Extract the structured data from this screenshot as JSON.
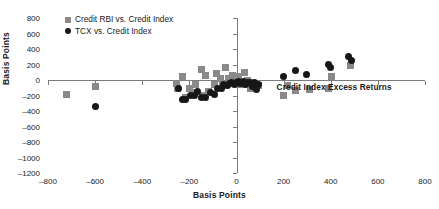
{
  "chart_data": {
    "type": "scatter",
    "title": "",
    "xlabel": "Basis Points",
    "ylabel": "Basis Points",
    "xlim": [
      -800,
      800
    ],
    "ylim": [
      -1200,
      800
    ],
    "xticks": [
      -800,
      -600,
      -400,
      -200,
      0,
      200,
      400,
      600,
      800
    ],
    "yticks": [
      800,
      600,
      400,
      200,
      0,
      -200,
      -400,
      -600,
      -800,
      -1000,
      -1200
    ],
    "grid": false,
    "legend_position": "top-left",
    "annotations": [
      {
        "text": "Credit Index Excess Returns",
        "x": 170,
        "y": -90
      }
    ],
    "series": [
      {
        "name": "Credit RBI vs. Credit Index",
        "marker": "square",
        "color": "#898989",
        "points": [
          [
            -720,
            -190
          ],
          [
            -600,
            -85
          ],
          [
            -255,
            -40
          ],
          [
            -250,
            -115
          ],
          [
            -230,
            40
          ],
          [
            -215,
            -230
          ],
          [
            -200,
            -105
          ],
          [
            -185,
            -160
          ],
          [
            -175,
            -60
          ],
          [
            -150,
            130
          ],
          [
            -145,
            -200
          ],
          [
            -130,
            55
          ],
          [
            -120,
            -145
          ],
          [
            -95,
            -60
          ],
          [
            -85,
            85
          ],
          [
            -70,
            25
          ],
          [
            -60,
            -70
          ],
          [
            -45,
            160
          ],
          [
            -35,
            15
          ],
          [
            -25,
            -30
          ],
          [
            -15,
            60
          ],
          [
            -5,
            -15
          ],
          [
            10,
            40
          ],
          [
            20,
            -55
          ],
          [
            35,
            100
          ],
          [
            45,
            -10
          ],
          [
            60,
            -105
          ],
          [
            75,
            -40
          ],
          [
            95,
            -75
          ],
          [
            200,
            -200
          ],
          [
            215,
            -75
          ],
          [
            250,
            -140
          ],
          [
            310,
            -120
          ],
          [
            390,
            -110
          ],
          [
            405,
            45
          ],
          [
            485,
            185
          ]
        ]
      },
      {
        "name": "TCX vs. Credit Index",
        "marker": "circle",
        "color": "#171717",
        "points": [
          [
            -600,
            -345
          ],
          [
            -245,
            -105
          ],
          [
            -230,
            -250
          ],
          [
            -215,
            -255
          ],
          [
            -195,
            -200
          ],
          [
            -180,
            -195
          ],
          [
            -165,
            -150
          ],
          [
            -150,
            -225
          ],
          [
            -130,
            -225
          ],
          [
            -110,
            -160
          ],
          [
            -95,
            -185
          ],
          [
            -80,
            -110
          ],
          [
            -65,
            -110
          ],
          [
            -55,
            -60
          ],
          [
            -40,
            -75
          ],
          [
            -30,
            -45
          ],
          [
            -20,
            -30
          ],
          [
            -10,
            -55
          ],
          [
            0,
            -35
          ],
          [
            8,
            -15
          ],
          [
            18,
            -45
          ],
          [
            28,
            -20
          ],
          [
            38,
            -60
          ],
          [
            48,
            -35
          ],
          [
            58,
            -30
          ],
          [
            68,
            -80
          ],
          [
            75,
            -30
          ],
          [
            85,
            -120
          ],
          [
            95,
            -55
          ],
          [
            200,
            50
          ],
          [
            250,
            120
          ],
          [
            295,
            75
          ],
          [
            390,
            205
          ],
          [
            400,
            155
          ],
          [
            475,
            300
          ],
          [
            490,
            250
          ]
        ]
      }
    ]
  },
  "legend": {
    "items": [
      {
        "label": "Credit RBI vs. Credit Index",
        "marker": "square"
      },
      {
        "label": "TCX vs. Credit Index",
        "marker": "circle"
      }
    ]
  }
}
